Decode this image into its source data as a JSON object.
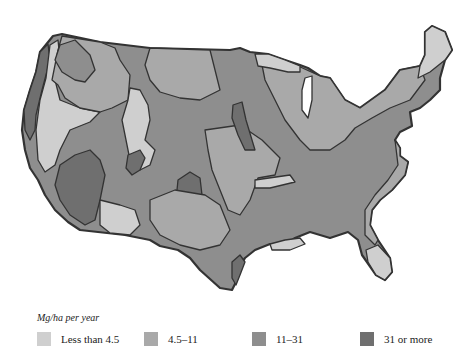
{
  "map": {
    "subject": "United States (contiguous) productivity map",
    "outline_color": "#333333",
    "classes": [
      {
        "label": "Less than 4.5",
        "color": "#cfcfcf"
      },
      {
        "label": "4.5–11",
        "color": "#a9a9a9"
      },
      {
        "label": "11–31",
        "color": "#8e8e8e"
      },
      {
        "label": "31 or more",
        "color": "#6f6f6f"
      }
    ]
  },
  "legend": {
    "title": "Mg/ha per year",
    "items": [
      {
        "label": "Less than 4.5",
        "color": "#cfcfcf"
      },
      {
        "label": "4.5–11",
        "color": "#a9a9a9"
      },
      {
        "label": "11–31",
        "color": "#8e8e8e"
      },
      {
        "label": "31 or more",
        "color": "#6f6f6f"
      }
    ]
  }
}
